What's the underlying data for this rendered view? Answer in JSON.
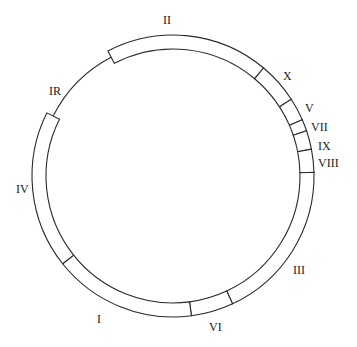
{
  "diagram": {
    "type": "circular-genome-map",
    "center": [
      173,
      176
    ],
    "outer_radius": 141,
    "inner_radius": 127,
    "line_radius": 134,
    "stroke_color": "#2a2a2a",
    "background": "#ffffff",
    "segments": [
      {
        "id": "II",
        "start": 242.5,
        "end": 310
      },
      {
        "id": "X",
        "start": 310,
        "end": 327
      },
      {
        "id": "V",
        "start": 327,
        "end": 336.5
      },
      {
        "id": "VII",
        "start": 336.5,
        "end": 341.3
      },
      {
        "id": "IX",
        "start": 341.3,
        "end": 349
      },
      {
        "id": "VIII",
        "start": 349,
        "end": 358.5
      },
      {
        "id": "III",
        "start": 358.5,
        "end": 425
      },
      {
        "id": "VI",
        "start": 425,
        "end": 442.5
      },
      {
        "id": "I",
        "start": 442.5,
        "end": 501.5
      },
      {
        "id": "IV",
        "start": 501.5,
        "end": 566.6
      }
    ],
    "thin_line": {
      "id": "IR",
      "start": 206.6,
      "end": 242.5
    },
    "labels": [
      {
        "text": "II",
        "x": 163,
        "y": 14
      },
      {
        "text": "X",
        "x": 283,
        "y": 70
      },
      {
        "text": "V",
        "x": 305,
        "y": 102
      },
      {
        "text": "VII",
        "x": 311,
        "y": 121
      },
      {
        "text": "IX",
        "x": 318,
        "y": 140
      },
      {
        "text": "VIII",
        "x": 318,
        "y": 157
      },
      {
        "text": "III",
        "x": 293,
        "y": 264
      },
      {
        "text": "VI",
        "x": 209,
        "y": 321
      },
      {
        "text": "I",
        "x": 97,
        "y": 313
      },
      {
        "text": "IV",
        "x": 16,
        "y": 183
      },
      {
        "text": "IR",
        "x": 49,
        "y": 85
      }
    ]
  }
}
